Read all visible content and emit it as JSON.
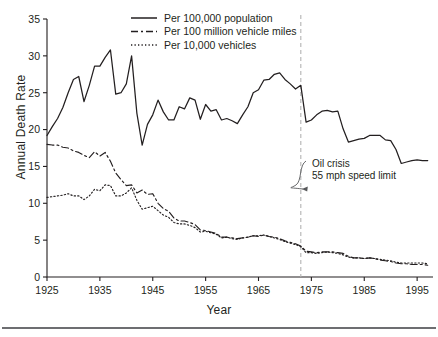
{
  "figure": {
    "background": "#ffffff",
    "ink": "#231f20",
    "rule_color": "#6d6e71",
    "annotation": {
      "line1": "Oil crisis",
      "line2": "55 mph speed limit",
      "marker_year": 1973,
      "marker_color": "#b3b3b3"
    }
  },
  "chart_data": {
    "type": "line",
    "title": "",
    "xlabel": "Year",
    "ylabel": "Annual Death Rate",
    "xlim": [
      1925,
      1998
    ],
    "ylim": [
      0,
      35
    ],
    "yticks": [
      0,
      5,
      10,
      15,
      20,
      25,
      30,
      35
    ],
    "xticks": [
      1925,
      1935,
      1945,
      1955,
      1965,
      1975,
      1985,
      1995
    ],
    "grid": false,
    "legend_position": "top-center",
    "series": [
      {
        "name": "Per 100,000 population",
        "style": "solid",
        "color": "#231f20",
        "x": [
          1925,
          1926,
          1927,
          1928,
          1929,
          1930,
          1931,
          1932,
          1933,
          1934,
          1935,
          1936,
          1937,
          1938,
          1939,
          1940,
          1941,
          1942,
          1943,
          1944,
          1945,
          1946,
          1947,
          1948,
          1949,
          1950,
          1951,
          1952,
          1953,
          1954,
          1955,
          1956,
          1957,
          1958,
          1959,
          1960,
          1961,
          1962,
          1963,
          1964,
          1965,
          1966,
          1967,
          1968,
          1969,
          1970,
          1971,
          1972,
          1973,
          1974,
          1975,
          1976,
          1977,
          1978,
          1979,
          1980,
          1981,
          1982,
          1983,
          1984,
          1985,
          1986,
          1987,
          1988,
          1989,
          1990,
          1991,
          1992,
          1993,
          1994,
          1995,
          1996,
          1997
        ],
        "values": [
          19.2,
          20.4,
          21.5,
          23.0,
          25.0,
          26.8,
          27.2,
          23.8,
          26.0,
          28.6,
          28.6,
          29.8,
          30.8,
          24.8,
          25.0,
          26.2,
          30.0,
          22.2,
          17.9,
          20.7,
          22.0,
          24.0,
          22.4,
          21.3,
          21.3,
          23.1,
          22.8,
          24.3,
          24.0,
          21.4,
          23.4,
          22.5,
          22.7,
          21.3,
          21.5,
          21.2,
          20.8,
          22.0,
          23.1,
          25.0,
          25.4,
          26.7,
          26.8,
          27.5,
          27.7,
          26.8,
          26.2,
          25.5,
          26.0,
          21.0,
          21.3,
          22.0,
          22.5,
          22.6,
          22.4,
          22.5,
          20.1,
          18.3,
          18.5,
          18.7,
          18.8,
          19.2,
          19.2,
          19.2,
          18.6,
          18.5,
          17.3,
          15.4,
          15.6,
          15.8,
          15.9,
          15.8,
          15.8
        ]
      },
      {
        "name": "Per 100 million vehicle miles",
        "style": "dashdot",
        "color": "#231f20",
        "x": [
          1925,
          1926,
          1927,
          1928,
          1929,
          1930,
          1931,
          1932,
          1933,
          1934,
          1935,
          1936,
          1937,
          1938,
          1939,
          1940,
          1941,
          1942,
          1943,
          1944,
          1945,
          1946,
          1947,
          1948,
          1949,
          1950,
          1951,
          1952,
          1953,
          1954,
          1955,
          1956,
          1957,
          1958,
          1959,
          1960,
          1961,
          1962,
          1963,
          1964,
          1965,
          1966,
          1967,
          1968,
          1969,
          1970,
          1971,
          1972,
          1973,
          1974,
          1975,
          1976,
          1977,
          1978,
          1979,
          1980,
          1981,
          1982,
          1983,
          1984,
          1985,
          1986,
          1987,
          1988,
          1989,
          1990,
          1991,
          1992,
          1993,
          1994,
          1995,
          1996,
          1997
        ],
        "values": [
          18.0,
          17.9,
          17.9,
          17.6,
          17.5,
          17.1,
          16.9,
          16.5,
          16.2,
          17.0,
          16.4,
          16.9,
          15.7,
          14.1,
          13.2,
          12.4,
          12.5,
          11.4,
          11.8,
          11.2,
          11.3,
          10.0,
          9.3,
          8.9,
          8.0,
          7.6,
          7.6,
          7.4,
          7.1,
          6.4,
          6.3,
          6.1,
          5.9,
          5.4,
          5.4,
          5.3,
          5.2,
          5.3,
          5.4,
          5.6,
          5.5,
          5.7,
          5.5,
          5.4,
          5.2,
          4.9,
          4.7,
          4.5,
          4.2,
          3.5,
          3.4,
          3.3,
          3.4,
          3.4,
          3.4,
          3.3,
          3.2,
          2.8,
          2.6,
          2.6,
          2.5,
          2.6,
          2.5,
          2.3,
          2.2,
          2.1,
          1.9,
          1.8,
          1.8,
          1.7,
          1.7,
          1.7,
          1.6
        ]
      },
      {
        "name": "Per 10,000 vehicles",
        "style": "dotted",
        "color": "#231f20",
        "x": [
          1925,
          1926,
          1927,
          1928,
          1929,
          1930,
          1931,
          1932,
          1933,
          1934,
          1935,
          1936,
          1937,
          1938,
          1939,
          1940,
          1941,
          1942,
          1943,
          1944,
          1945,
          1946,
          1947,
          1948,
          1949,
          1950,
          1951,
          1952,
          1953,
          1954,
          1955,
          1956,
          1957,
          1958,
          1959,
          1960,
          1961,
          1962,
          1963,
          1964,
          1965,
          1966,
          1967,
          1968,
          1969,
          1970,
          1971,
          1972,
          1973,
          1974,
          1975,
          1976,
          1977,
          1978,
          1979,
          1980,
          1981,
          1982,
          1983,
          1984,
          1985,
          1986,
          1987,
          1988,
          1989,
          1990,
          1991,
          1992,
          1993,
          1994,
          1995,
          1996,
          1997
        ],
        "values": [
          10.8,
          10.9,
          11.0,
          11.1,
          11.3,
          11.0,
          11.0,
          10.5,
          11.0,
          11.9,
          11.7,
          12.5,
          12.4,
          11.0,
          11.0,
          11.4,
          12.1,
          10.4,
          9.2,
          9.4,
          9.6,
          9.0,
          8.4,
          8.1,
          7.4,
          7.2,
          7.2,
          7.0,
          6.7,
          6.1,
          6.2,
          6.0,
          5.8,
          5.3,
          5.4,
          5.2,
          5.1,
          5.3,
          5.4,
          5.6,
          5.6,
          5.7,
          5.5,
          5.3,
          5.1,
          4.8,
          4.6,
          4.4,
          4.1,
          3.3,
          3.3,
          3.2,
          3.3,
          3.4,
          3.3,
          3.2,
          3.0,
          2.7,
          2.6,
          2.6,
          2.5,
          2.6,
          2.5,
          2.4,
          2.3,
          2.2,
          2.0,
          1.9,
          1.9,
          1.9,
          1.9,
          1.9,
          1.8
        ]
      }
    ]
  }
}
